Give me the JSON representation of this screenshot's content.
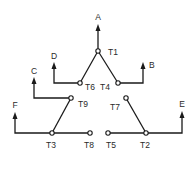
{
  "diagram": {
    "title": "",
    "leads": [
      {
        "id": "A",
        "label": "A"
      },
      {
        "id": "B",
        "label": "B"
      },
      {
        "id": "C",
        "label": "C"
      },
      {
        "id": "D",
        "label": "D"
      },
      {
        "id": "E",
        "label": "E"
      },
      {
        "id": "F",
        "label": "F"
      }
    ],
    "terminals": [
      {
        "id": "T1",
        "label": "T1"
      },
      {
        "id": "T2",
        "label": "T2"
      },
      {
        "id": "T3",
        "label": "T3"
      },
      {
        "id": "T4",
        "label": "T4"
      },
      {
        "id": "T5",
        "label": "T5"
      },
      {
        "id": "T6",
        "label": "T6"
      },
      {
        "id": "T7",
        "label": "T7"
      },
      {
        "id": "T8",
        "label": "T8"
      },
      {
        "id": "T9",
        "label": "T9"
      }
    ],
    "connections": [
      {
        "from": "T1",
        "to": "A"
      },
      {
        "from": "T1",
        "to": "T6"
      },
      {
        "from": "T1",
        "to": "T4"
      },
      {
        "from": "T6",
        "to": "D"
      },
      {
        "from": "T4",
        "to": "B"
      },
      {
        "from": "T9",
        "to": "C"
      },
      {
        "from": "T9",
        "to": "T3"
      },
      {
        "from": "T3",
        "to": "F"
      },
      {
        "from": "T3",
        "to": "T8"
      },
      {
        "from": "T7",
        "to": "T2"
      },
      {
        "from": "T5",
        "to": "T2"
      },
      {
        "from": "T2",
        "to": "E"
      }
    ]
  }
}
